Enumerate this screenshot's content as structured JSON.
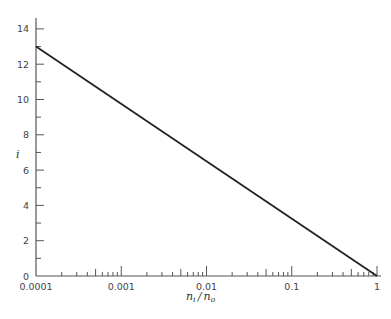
{
  "chart_data": {
    "type": "line",
    "title": "",
    "xlabel": "n_i / n_o",
    "ylabel": "i",
    "xscale": "log",
    "xlim": [
      0.0001,
      1
    ],
    "ylim": [
      0,
      14.5
    ],
    "grid": false,
    "legend": null,
    "x_tick_labels": [
      "0.0001",
      "0.001",
      "0.01",
      "0.1",
      "1"
    ],
    "x_ticks": [
      0.0001,
      0.001,
      0.01,
      0.1,
      1
    ],
    "y_tick_labels": [
      "0",
      "2",
      "4",
      "6",
      "8",
      "10",
      "12",
      "14"
    ],
    "y_ticks": [
      0,
      2,
      4,
      6,
      8,
      10,
      12,
      14
    ],
    "series": [
      {
        "name": "i vs n_i/n_o",
        "color": "#222222",
        "x": [
          0.0001,
          1
        ],
        "y": [
          13,
          0
        ]
      }
    ]
  },
  "labels": {
    "xlabel_main": "n",
    "xlabel_sub1": "i",
    "xlabel_slash": "/",
    "xlabel_main2": "n",
    "xlabel_sub2": "o",
    "ylabel": "i"
  },
  "colors": {
    "line": "#222222",
    "axis": "#555555",
    "text": "#444444"
  }
}
